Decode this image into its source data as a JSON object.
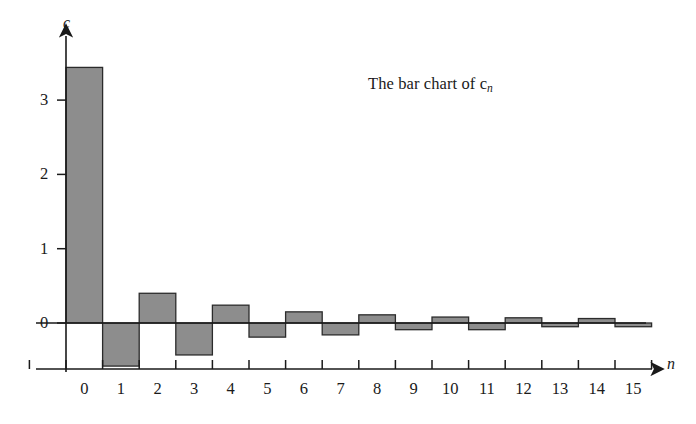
{
  "chart_data": {
    "type": "bar",
    "title": "The bar chart of c",
    "title_sub": "n",
    "title_full": "The bar chart of c_n",
    "xlabel": "n",
    "ylabel": "c",
    "categories": [
      0,
      1,
      2,
      3,
      4,
      5,
      6,
      7,
      8,
      9,
      10,
      11,
      12,
      13,
      14,
      15
    ],
    "values": [
      3.44,
      -0.58,
      0.4,
      -0.43,
      0.24,
      -0.19,
      0.15,
      -0.16,
      0.11,
      -0.09,
      0.08,
      -0.09,
      0.07,
      -0.05,
      0.06,
      -0.05
    ],
    "x_tick_labels": [
      "0",
      "1",
      "2",
      "3",
      "4",
      "5",
      "6",
      "7",
      "8",
      "9",
      "10",
      "11",
      "12",
      "13",
      "14",
      "15"
    ],
    "y_tick_labels": [
      "0",
      "1",
      "2",
      "3"
    ],
    "y_tick_values": [
      0,
      1,
      2,
      3
    ],
    "xlim": [
      0,
      16
    ],
    "ylim": [
      -0.9,
      3.75
    ],
    "grid": false,
    "legend": null,
    "bar_fill_color": "#8d8d8d",
    "bar_edge_color": "#2b2b2b",
    "axis_color": "#1a1a1a",
    "background_color": "#ffffff"
  }
}
